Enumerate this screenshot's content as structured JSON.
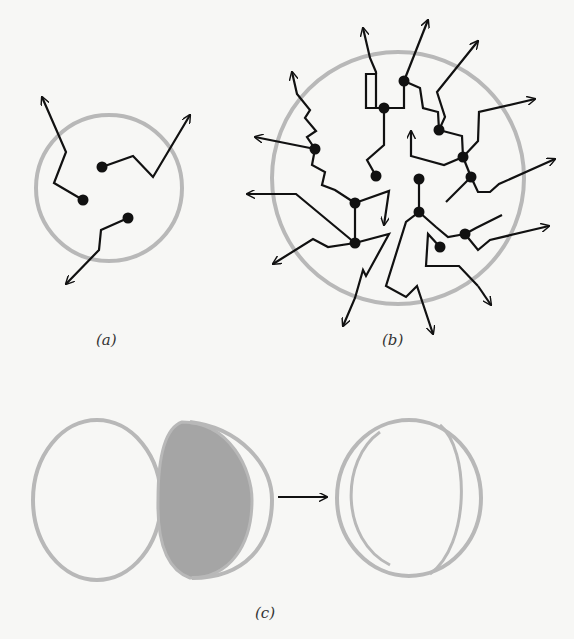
{
  "panels": {
    "a": {
      "label": "(a)"
    },
    "b": {
      "label": "(b)"
    },
    "c": {
      "label": "(c)"
    }
  },
  "colors": {
    "ink": "#111111",
    "circle": "#b8b8b8",
    "shade": "#9a9a9a",
    "background": "#f7f7f5"
  }
}
